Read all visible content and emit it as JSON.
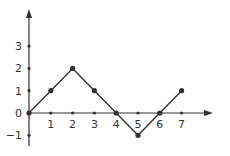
{
  "chart_data": {
    "type": "line",
    "title": "",
    "xlabel": "",
    "ylabel": "",
    "x": [
      0,
      1,
      2,
      3,
      4,
      5,
      6,
      7
    ],
    "values": [
      0,
      1,
      2,
      1,
      0,
      -1,
      0,
      1
    ],
    "x_ticks": [
      "1",
      "2",
      "3",
      "4",
      "5",
      "6",
      "7"
    ],
    "y_ticks": [
      "-1",
      "0",
      "1",
      "2",
      "3"
    ],
    "xlim": [
      0,
      8
    ],
    "ylim": [
      -1.5,
      4.5
    ],
    "grid": false,
    "legend": null
  },
  "colors": {
    "line": "#333333",
    "axis": "#333333"
  }
}
